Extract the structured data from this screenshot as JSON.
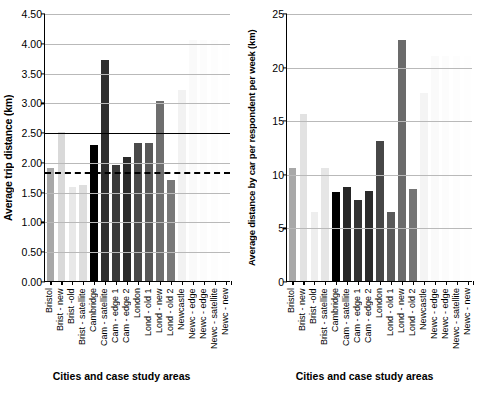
{
  "figure": {
    "background": "#ffffff"
  },
  "chart_data": [
    {
      "type": "bar",
      "panel": "left",
      "title": "",
      "ylabel": "Average trip distance (km)",
      "xlabel": "Cities and case study areas",
      "ylim": [
        0,
        4.5
      ],
      "yticks": [
        "0.00",
        "0.50",
        "1.00",
        "1.50",
        "2.00",
        "2.50",
        "3.00",
        "3.50",
        "4.00",
        "4.50"
      ],
      "ytick_values": [
        0,
        0.5,
        1,
        1.5,
        2,
        2.5,
        3,
        3.5,
        4,
        4.5
      ],
      "grid": true,
      "legend": "none",
      "categories": [
        "Bristol",
        "Brist - new",
        "Brist -old",
        "Brist - satellite",
        "Cambridge",
        "Cam - satellite",
        "Cam - edge 1",
        "Cam - edge 2",
        "London",
        "Lond - old 1",
        "Lond - new",
        "Lond - old 2",
        "Newcastle",
        "Newc - edge",
        "Newc - edge",
        "Newc - satellite",
        "Newc - new"
      ],
      "values": [
        1.9,
        2.5,
        1.58,
        1.62,
        2.29,
        3.71,
        1.95,
        2.08,
        2.31,
        2.32,
        3.02,
        1.7,
        3.21,
        4.05,
        4.05,
        4.05,
        4.05
      ],
      "colors": [
        "#a8a8a8",
        "#d9d9d9",
        "#e8e8e8",
        "#dedede",
        "#000000",
        "#2e2e2e",
        "#3a3a3a",
        "#2a2a2a",
        "#4a4a4a",
        "#585858",
        "#6e6e6e",
        "#787878",
        "#f2f2f2",
        "#fafafa",
        "#fcfcfc",
        "#fdfdfd",
        "#fefefe"
      ],
      "annotations": [
        {
          "name": "solid-reference-line",
          "value": 2.51,
          "style": "solid"
        },
        {
          "name": "dashed-reference-line",
          "value": 1.85,
          "style": "dashed"
        }
      ]
    },
    {
      "type": "bar",
      "panel": "right",
      "title": "",
      "ylabel": "Average distance by car per respondent per week (km)",
      "xlabel": "Cities and case study areas",
      "ylim": [
        0,
        25
      ],
      "yticks": [
        "0",
        "5",
        "10",
        "15",
        "20",
        "25"
      ],
      "ytick_values": [
        0,
        5,
        10,
        15,
        20,
        25
      ],
      "grid": true,
      "legend": "none",
      "categories": [
        "Bristol",
        "Brist - new",
        "Brist -old",
        "Brist - satellite",
        "Cambridge",
        "Cam - satellite",
        "Cam - edge 1",
        "Cam - edge 2",
        "London",
        "Lond - old 1",
        "Lond - new",
        "Lond - old 2",
        "Newcastle",
        "Newc - edge",
        "Newc - edge",
        "Newc - satellite",
        "Newc - new"
      ],
      "values": [
        10.5,
        15.6,
        6.4,
        10.5,
        8.3,
        8.8,
        7.6,
        8.4,
        13.1,
        6.4,
        22.5,
        8.6,
        17.5,
        21.0,
        21.0,
        21.0,
        21.0
      ],
      "colors": [
        "#a8a8a8",
        "#e2e2e2",
        "#eeeeee",
        "#e6e6e6",
        "#000000",
        "#262626",
        "#333333",
        "#2b2b2b",
        "#474747",
        "#5a5a5a",
        "#6b6b6b",
        "#757575",
        "#f4f4f4",
        "#fafafa",
        "#fcfcfc",
        "#fdfdfd",
        "#fefefe"
      ],
      "annotations": []
    }
  ]
}
